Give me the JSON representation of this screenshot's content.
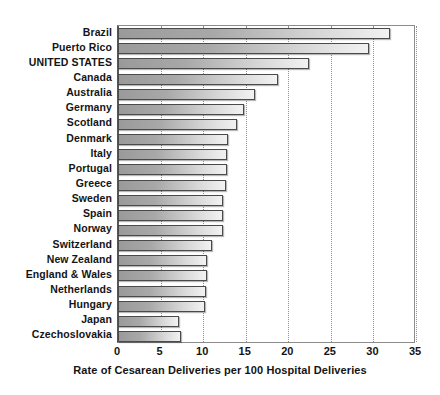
{
  "chart_data": {
    "type": "bar",
    "orientation": "horizontal",
    "title": "",
    "xlabel": "Rate of Cesarean Deliveries per 100 Hospital Deliveries",
    "ylabel": "",
    "xlim": [
      0,
      35
    ],
    "xticks": [
      0,
      5,
      10,
      15,
      20,
      25,
      30,
      35
    ],
    "xtick_labels": [
      "0",
      "5",
      "10",
      "15",
      "20",
      "25",
      "30",
      "35"
    ],
    "grid": "vertical-dotted",
    "legend": "none",
    "categories": [
      "Brazil",
      "Puerto Rico",
      "UNITED STATES",
      "Canada",
      "Australia",
      "Germany",
      "Scotland",
      "Denmark",
      "Italy",
      "Portugal",
      "Greece",
      "Sweden",
      "Spain",
      "Norway",
      "Switzerland",
      "New Zealand",
      "England & Wales",
      "Netherlands",
      "Hungary",
      "Japan",
      "Czechoslovakia"
    ],
    "values": [
      32.0,
      29.5,
      22.4,
      18.8,
      16.1,
      14.8,
      14.0,
      12.9,
      12.8,
      12.8,
      12.7,
      12.3,
      12.3,
      12.3,
      11.0,
      10.5,
      10.4,
      10.3,
      10.2,
      7.2,
      7.4
    ],
    "bar_color_start": "#9a9a9a",
    "bar_color_end": "#f2f2f2",
    "bar_border_color": "#4a4a4a",
    "grid_color": "#909090",
    "axis_color": "#555555",
    "text_color": "#141414"
  }
}
